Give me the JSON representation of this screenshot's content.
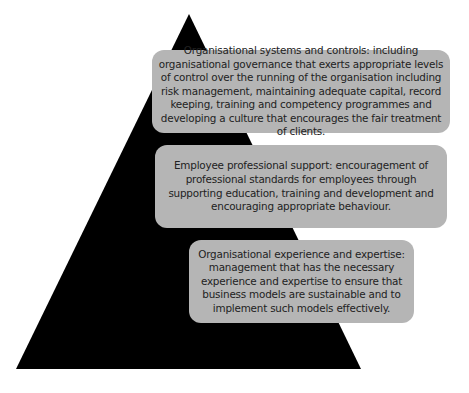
{
  "diagram": {
    "type": "pyramid",
    "colors": {
      "pyramid_fill": "#000000",
      "box_fill": "#b5b5b5",
      "text": "#222222",
      "background": "#ffffff"
    },
    "tiers": [
      {
        "position": "top",
        "text": "Organisational systems and controls: including organisational governance that exerts appropriate levels of control over the running of the organisation including risk management, maintaining adequate capital, record keeping, training and competency programmes and developing a culture that encourages the fair treatment of clients."
      },
      {
        "position": "middle",
        "text": "Employee professional support: encouragement of professional standards for employees through supporting education, training and development and encouraging appropriate behaviour."
      },
      {
        "position": "bottom",
        "text": "Organisational experience and expertise: management that has the necessary experience and expertise to ensure that business models are sustainable and to implement such models effectively."
      }
    ]
  }
}
